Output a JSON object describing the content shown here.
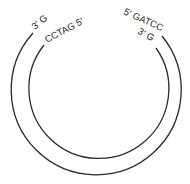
{
  "diagram": {
    "type": "circular-dna-sticky-ends",
    "stroke_color": "#2a2a2a",
    "labels": {
      "left_outer": "3′ G",
      "left_inner": "CCTAG 5′",
      "right_outer": "5′ GATCC",
      "right_inner": "3′ G"
    }
  }
}
